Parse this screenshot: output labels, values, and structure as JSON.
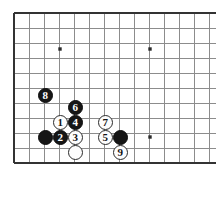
{
  "figure": {
    "kind": "go-board-diagram",
    "title": "",
    "board": {
      "origin_x": 14,
      "origin_y": 13,
      "spacing": 15,
      "cols": 13,
      "rows": 11,
      "line_color": "#8c8c8c",
      "edge_color": "#333333",
      "background": "#ffffff",
      "stone_radius": 7.5,
      "star_points": [
        {
          "name": "star-point-top-left",
          "x": 60,
          "y": 49
        },
        {
          "name": "star-point-top-right",
          "x": 150,
          "y": 49
        },
        {
          "name": "star-point-bottom-right",
          "x": 150,
          "y": 137
        }
      ]
    },
    "stones": [
      {
        "id": "stone-8",
        "color": "black",
        "label": "8",
        "x": 45,
        "y": 95
      },
      {
        "id": "stone-6",
        "color": "black",
        "label": "6",
        "x": 75,
        "y": 107
      },
      {
        "id": "stone-1",
        "color": "white",
        "label": "1",
        "x": 60,
        "y": 122
      },
      {
        "id": "stone-4",
        "color": "black",
        "label": "4",
        "x": 75,
        "y": 122
      },
      {
        "id": "stone-7",
        "color": "white",
        "label": "7",
        "x": 105,
        "y": 122
      },
      {
        "id": "stone-black-corner",
        "color": "black",
        "label": "",
        "x": 45,
        "y": 137
      },
      {
        "id": "stone-2",
        "color": "black",
        "label": "2",
        "x": 60,
        "y": 137
      },
      {
        "id": "stone-3",
        "color": "white",
        "label": "3",
        "x": 75,
        "y": 137
      },
      {
        "id": "stone-5",
        "color": "white",
        "label": "5",
        "x": 105,
        "y": 137
      },
      {
        "id": "stone-black-right",
        "color": "black",
        "label": "",
        "x": 120,
        "y": 137
      },
      {
        "id": "stone-white-blank",
        "color": "white",
        "label": "",
        "x": 75,
        "y": 152
      },
      {
        "id": "stone-9",
        "color": "white",
        "label": "9",
        "x": 120,
        "y": 152
      }
    ]
  }
}
